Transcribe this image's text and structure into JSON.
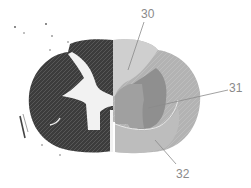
{
  "figure": {
    "labels": [
      {
        "id": "label-30",
        "text": "30",
        "x": 141,
        "y": 8
      },
      {
        "id": "label-31",
        "text": "31",
        "x": 229,
        "y": 82
      },
      {
        "id": "label-32",
        "text": "32",
        "x": 176,
        "y": 168
      }
    ],
    "colors": {
      "background": "#ffffff",
      "left_half_dark": "#3c3c3c",
      "left_half_texture": "#6a6a6a",
      "central_white": "#f2f2f2",
      "posterior_region": "#cfcfcf",
      "lateral_ring": "#b3b3b3",
      "inner_wedge": "#8f8f8f",
      "central_region": "#a0a0a0",
      "anterior_region": "#bdbdbd",
      "leader_line": "#8a8a8a",
      "label_text": "#8a8a8a"
    }
  }
}
